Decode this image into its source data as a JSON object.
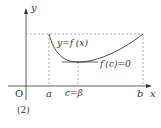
{
  "figure": {
    "axis_y_label": "y",
    "axis_x_label": "x",
    "origin_label": "O",
    "curve_label": "y=f (x)",
    "tangent_label": "f′(c)=0",
    "tick_a": "a",
    "tick_c": "c=β",
    "tick_b": "b",
    "caption": "(2)"
  },
  "colors": {
    "line": "#333333",
    "dash": "#777777"
  }
}
